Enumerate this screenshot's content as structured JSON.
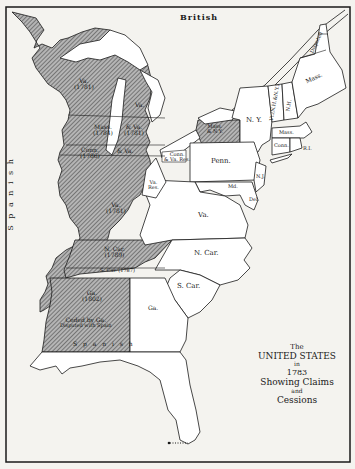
{
  "map": {
    "title_lines": [
      "The",
      "UNITED STATES",
      "in",
      "1783",
      "Showing Claims",
      "and",
      "Cessions"
    ],
    "colors": {
      "background": "#f4f3ef",
      "border": "#1a1a1a",
      "hatch_fill": "#8a8a8a",
      "land": "#ffffff"
    },
    "regions": {
      "british": "British",
      "spanish_west": "S p a n i s h",
      "spanish_south": "S p a n i s h",
      "va_1781_north": "Va.",
      "va_1781_north_year": "(1781)",
      "va_michigan": "Va.",
      "mass_1784": "Mass.",
      "mass_1784_year": "(1784)",
      "va_1781_mid": "& Va.",
      "va_1781_mid_year": "(1781)",
      "conn_1786": "Conn.",
      "conn_1786_year": "(1786)",
      "conn_va": "& Va.",
      "conn_res": "Conn.",
      "conn_res_sub": "& Va. Res.",
      "va_res": "Va.",
      "va_res_sub": "Res.",
      "va_1781_south": "Va.",
      "va_1781_south_year": "(1781)",
      "ncar_1789": "N. Car.",
      "ncar_1789_year": "(1789)",
      "sc_1787": "S. Car. (1787)",
      "ga_1802": "Ga.",
      "ga_1802_year": "(1802)",
      "ceded_ga": "Ceded by Ga.",
      "disputed_spain": "Disputed with Spain",
      "mass_ny": "Mass.",
      "mass_ny_sub": "& N.Y.",
      "ny": "N. Y.",
      "vt": "Vt.(N.H.&N.Y.)",
      "nh": "N.H.",
      "mass_maine": "Mass.",
      "disputed_maine": "Disputed",
      "mass": "Mass.",
      "conn": "Conn.",
      "ri": "R.I.",
      "penn": "Penn.",
      "nj": "N.J.",
      "md": "Md.",
      "del": "Del.",
      "va": "Va.",
      "ncar": "N. Car.",
      "scar": "S. Car.",
      "ga": "Ga."
    }
  }
}
